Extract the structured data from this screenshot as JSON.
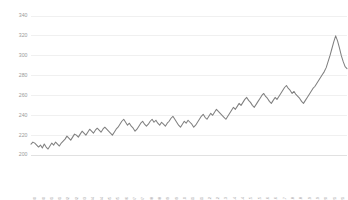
{
  "chart_data": {
    "type": "line",
    "title": "",
    "subtitle": "",
    "xlabel": "",
    "ylabel": "",
    "grid": true,
    "grid_color": "#e9e9e9",
    "legend": false,
    "legend_position": "none",
    "background_color": "#ffffff",
    "line_color": "#808080",
    "tick_label_color": "#9a9a9a",
    "ylim": [
      200,
      340
    ],
    "ytick_labels": [
      "340",
      "320",
      "300",
      "280",
      "260",
      "240",
      "220",
      "200"
    ],
    "ytick_values": [
      340,
      320,
      300,
      280,
      260,
      240,
      220,
      200
    ],
    "xtick_labels": [
      "1/1/2000",
      "8/1/2000",
      "3/1/2001",
      "10/1/2001",
      "5/1/2002",
      "12/1/2002",
      "7/1/2003",
      "2/1/2004",
      "9/1/2004",
      "4/1/2005",
      "11/1/2005",
      "6/1/2006",
      "1/1/2007",
      "8/1/2007",
      "3/1/2008",
      "10/1/2008",
      "5/1/2009",
      "12/1/2009",
      "7/1/2010",
      "2/1/2011",
      "9/1/2011",
      "4/1/2012",
      "11/1/2012",
      "6/1/2013",
      "1/1/2014",
      "8/1/2014",
      "3/1/2015",
      "10/1/2015",
      "5/1/2016",
      "12/1/2016",
      "7/1/2017",
      "2/1/2018",
      "9/1/2018",
      "4/1/2019",
      "11/1/2019",
      "6/1/2020",
      "1/1/2021",
      "8/1/2021"
    ],
    "series": [
      {
        "name": "Series 1",
        "values": [
          211,
          213,
          212,
          210,
          208,
          210,
          207,
          211,
          208,
          206,
          209,
          212,
          210,
          213,
          211,
          209,
          212,
          214,
          216,
          219,
          217,
          215,
          218,
          221,
          220,
          218,
          221,
          224,
          222,
          220,
          223,
          226,
          224,
          222,
          225,
          227,
          225,
          223,
          226,
          228,
          226,
          224,
          222,
          220,
          223,
          226,
          228,
          231,
          234,
          236,
          233,
          230,
          232,
          229,
          227,
          224,
          226,
          229,
          232,
          234,
          231,
          229,
          231,
          234,
          236,
          233,
          235,
          232,
          230,
          233,
          231,
          229,
          232,
          234,
          237,
          239,
          236,
          233,
          230,
          228,
          231,
          234,
          232,
          235,
          233,
          231,
          228,
          230,
          233,
          236,
          239,
          241,
          238,
          236,
          239,
          242,
          240,
          243,
          246,
          244,
          242,
          240,
          238,
          236,
          239,
          242,
          245,
          248,
          246,
          249,
          252,
          250,
          253,
          256,
          258,
          255,
          253,
          250,
          248,
          251,
          254,
          257,
          260,
          262,
          259,
          257,
          254,
          252,
          255,
          258,
          256,
          259,
          262,
          265,
          268,
          270,
          267,
          265,
          262,
          264,
          261,
          259,
          257,
          254,
          252,
          255,
          258,
          261,
          264,
          267,
          269,
          272,
          275,
          278,
          281,
          284,
          288,
          294,
          300,
          307,
          314,
          320,
          315,
          308,
          300,
          294,
          289,
          287
        ]
      }
    ],
    "point_count": 168,
    "min_value": 206,
    "max_value": 320,
    "first_value": 211,
    "last_value": 287
  }
}
